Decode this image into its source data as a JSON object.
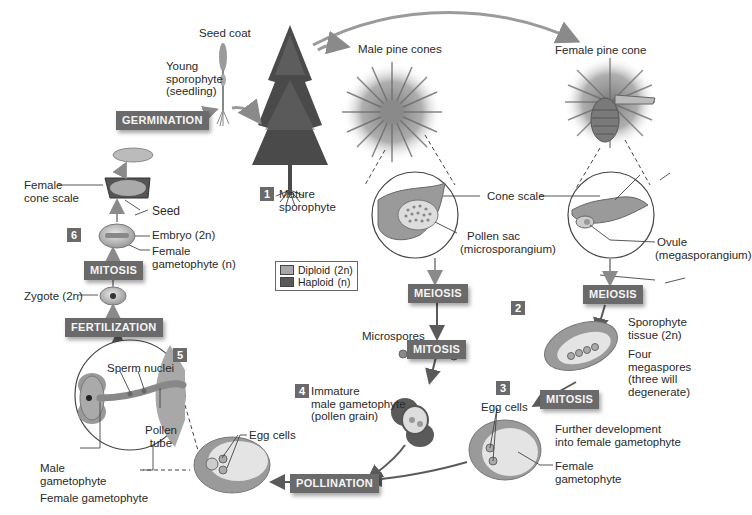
{
  "colors": {
    "stage_box": "#6a6a6a",
    "diploid": "#a8a8a8",
    "haploid": "#595959",
    "arrow": "#8a8a8a",
    "arrow_dark": "#5a5a5a"
  },
  "stages": {
    "germination": "GERMINATION",
    "meiosis_male": "MEIOSIS",
    "meiosis_female": "MEIOSIS",
    "mitosis_male": "MITOSIS",
    "mitosis_female": "MITOSIS",
    "mitosis_seed": "MITOSIS",
    "fertilization": "FERTILIZATION",
    "pollination": "POLLINATION"
  },
  "step_numbers": [
    "1",
    "2",
    "3",
    "4",
    "5",
    "6"
  ],
  "labels": {
    "seed_coat": "Seed coat",
    "young_sporophyte": [
      "Young",
      "sporophyte",
      "(seedling)"
    ],
    "mature_sporophyte": [
      "Mature",
      "sporophyte"
    ],
    "male_pine_cones": "Male pine cones",
    "female_pine_cone": "Female pine cone",
    "cone_scale": "Cone scale",
    "pollen_sac": [
      "Pollen sac",
      "(microsporangium)"
    ],
    "ovule": [
      "Ovule",
      "(megasporangium)"
    ],
    "female_cone_scale": [
      "Female",
      "cone scale"
    ],
    "seed": "Seed",
    "embryo": "Embryo (2n)",
    "female_gametophyte_n": [
      "Female",
      "gametophyte (n)"
    ],
    "zygote": "Zygote (2n)",
    "microspores": "Microspores",
    "immature_male_gametophyte": [
      "Immature",
      "male gametophyte",
      "(pollen grain)"
    ],
    "sporophyte_tissue": [
      "Sporophyte",
      "tissue (2n)"
    ],
    "four_megaspores": [
      "Four",
      "megaspores",
      "(three will",
      "degenerate)"
    ],
    "egg_cells_right": "Egg cells",
    "further_development": [
      "Further development",
      "into female gametophyte"
    ],
    "female_gametophyte_right": [
      "Female",
      "gametophyte"
    ],
    "sperm_nuclei": "Sperm nuclei",
    "pollen_tube": [
      "Pollen",
      "tube"
    ],
    "male_gametophyte": [
      "Male",
      "gametophyte"
    ],
    "female_gametophyte_bottom": "Female gametophyte",
    "egg_cells_bottom": "Egg cells"
  },
  "legend": {
    "diploid": "Diploid",
    "diploid_ploidy": "(2n)",
    "haploid": "Haploid",
    "haploid_ploidy": "(n)"
  }
}
